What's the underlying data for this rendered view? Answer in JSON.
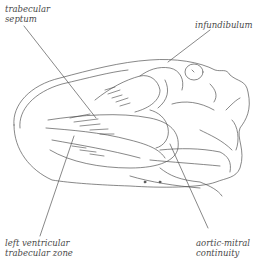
{
  "diagram": {
    "type": "anatomical line drawing (heart)",
    "labels": {
      "trabecular_septum": [
        "trabecular",
        "septum"
      ],
      "infundibulum": [
        "infundibulum"
      ],
      "left_ventricular_trabecular_zone": [
        "left ventricular",
        "trabecular zone"
      ],
      "aortic_mitral_continuity": [
        "aortic-mitral",
        "continuity"
      ]
    },
    "colors": {
      "line": "#555555",
      "text": "#4a4a4a",
      "background": "#ffffff"
    }
  }
}
